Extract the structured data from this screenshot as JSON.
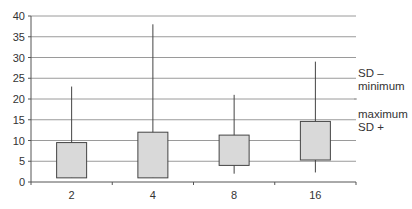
{
  "chart_data": {
    "type": "box",
    "title": "",
    "xlabel": "",
    "ylabel": "",
    "ylim": [
      0,
      40
    ],
    "yticks": [
      0,
      5,
      10,
      15,
      20,
      25,
      30,
      35,
      40
    ],
    "grid": true,
    "categories": [
      "2",
      "4",
      "8",
      "16"
    ],
    "series": [
      {
        "name": "maximum",
        "values": [
          23,
          38,
          21,
          29
        ]
      },
      {
        "name": "SD +",
        "values": [
          9.5,
          12,
          11.3,
          14.6
        ]
      },
      {
        "name": "SD -",
        "values": [
          1,
          1,
          4,
          5.3
        ]
      },
      {
        "name": "minimum",
        "values": [
          1,
          1,
          2,
          2.3
        ]
      }
    ],
    "legend": {
      "position": "right",
      "entries": [
        "SD –\nminimum",
        "maximum\nSD +"
      ]
    }
  },
  "legend": {
    "line1a": "SD –",
    "line1b": "minimum",
    "line2a": "maximum",
    "line2b": "SD +"
  },
  "style": {
    "box_fill": "#d9d9d9",
    "box_stroke": "#444444",
    "grid_color": "#9a9a9a",
    "axis_color": "#555555"
  }
}
